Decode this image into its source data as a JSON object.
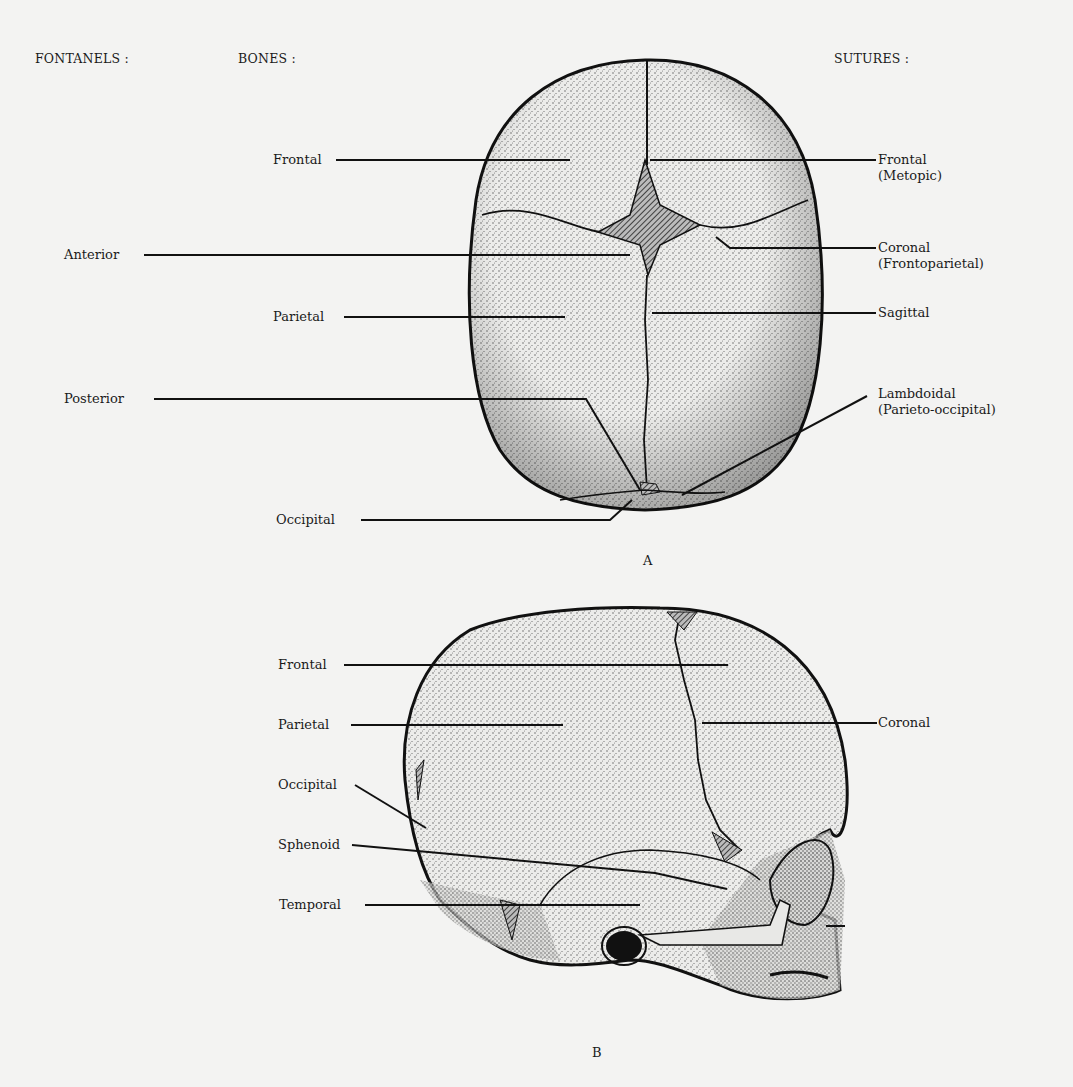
{
  "headers": {
    "fontanels": "FONTANELS :",
    "bones": "BONES :",
    "sutures": "SUTURES :"
  },
  "figure_a": {
    "caption": "A",
    "view": "superior view of infant skull",
    "fontanels": [
      {
        "label": "Anterior"
      },
      {
        "label": "Posterior"
      }
    ],
    "bones": [
      {
        "label": "Frontal"
      },
      {
        "label": "Parietal"
      },
      {
        "label": "Occipital"
      }
    ],
    "sutures": [
      {
        "label": "Frontal",
        "sub": "(Metopic)"
      },
      {
        "label": "Coronal",
        "sub": "(Frontoparietal)"
      },
      {
        "label": "Sagittal"
      },
      {
        "label": "Lambdoidal",
        "sub": "(Parieto-occipital)"
      }
    ]
  },
  "figure_b": {
    "caption": "B",
    "view": "lateral view of infant skull",
    "bones": [
      {
        "label": "Frontal"
      },
      {
        "label": "Parietal"
      },
      {
        "label": "Occipital"
      },
      {
        "label": "Sphenoid"
      },
      {
        "label": "Temporal"
      }
    ],
    "sutures": [
      {
        "label": "Coronal"
      }
    ]
  },
  "colors": {
    "background": "#f3f3f2",
    "ink": "#1a1a1a",
    "bone_fill": "#e4e4e2"
  }
}
